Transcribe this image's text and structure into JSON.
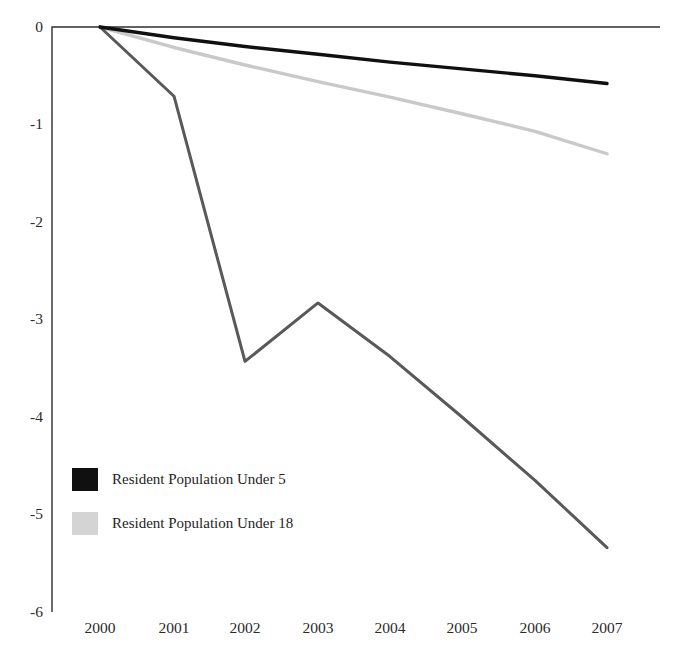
{
  "chart_data": {
    "type": "line",
    "title": "",
    "subtitle": "",
    "xlabel": "",
    "ylabel": "",
    "x": [
      2000,
      2001,
      2002,
      2003,
      2004,
      2005,
      2006,
      2007
    ],
    "categories": [
      "2000",
      "2001",
      "2002",
      "2003",
      "2004",
      "2005",
      "2006",
      "2007"
    ],
    "xtick_labels": [
      "2000",
      "2001",
      "2002",
      "2003",
      "2004",
      "2005",
      "2006",
      "2007"
    ],
    "ytick_labels": [
      "0",
      "-1",
      "-2",
      "-3",
      "-4",
      "-5",
      "-6"
    ],
    "ytick_values": [
      0,
      -1,
      -2,
      -3,
      -4,
      -5,
      -6
    ],
    "ylim": [
      -6,
      0
    ],
    "xlim": [
      2000,
      2007
    ],
    "grid": false,
    "legend_position": "inside-lower-left",
    "series": [
      {
        "name": "Resident Population Under 5",
        "color": "#101010",
        "width": 3.4,
        "in_legend": true,
        "values": [
          0,
          -0.11,
          -0.2,
          -0.28,
          -0.36,
          -0.43,
          -0.5,
          -0.58
        ]
      },
      {
        "name": "Resident Population Under 18",
        "color": "#c9c9c9",
        "width": 3.4,
        "in_legend": true,
        "values": [
          0,
          -0.21,
          -0.39,
          -0.56,
          -0.72,
          -0.89,
          -1.07,
          -1.3
        ]
      },
      {
        "name": "",
        "color": "#595959",
        "width": 3.0,
        "in_legend": false,
        "values": [
          0,
          -0.71,
          -3.43,
          -2.83,
          -3.38,
          -4.0,
          -4.65,
          -5.34
        ]
      }
    ]
  },
  "legend": {
    "entries": [
      {
        "label": "Resident Population Under 5",
        "swatch_color": "#101010"
      },
      {
        "label": "Resident Population Under 18",
        "swatch_color": "#d4d4d4"
      }
    ]
  },
  "axis": {
    "axis_color": "#2e2e2e",
    "tick_label_color": "#2b2b2b"
  }
}
